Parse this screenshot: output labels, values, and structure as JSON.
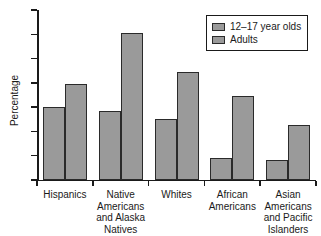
{
  "chart_data": {
    "type": "bar",
    "title": "",
    "xlabel": "",
    "ylabel": "Percentage",
    "ylim": [
      0,
      14
    ],
    "yticks": [
      0,
      2,
      4,
      6,
      8,
      10,
      12,
      14
    ],
    "ytick_labels": [
      "0",
      "2",
      "4",
      "6",
      "8",
      "10",
      "12",
      "14"
    ],
    "grid": false,
    "legend_position": "top-right",
    "categories": [
      "Hispanics",
      "Native Americans and Alaska Natives",
      "Whites",
      "African Americans",
      "Asian Americans and Pacific Islanders"
    ],
    "category_label_lines": [
      [
        "Hispanics"
      ],
      [
        "Native",
        "Americans",
        "and Alaska",
        "Natives"
      ],
      [
        "Whites"
      ],
      [
        "African",
        "Americans"
      ],
      [
        "Asian",
        "Americans",
        "and Pacific",
        "Islanders"
      ]
    ],
    "series": [
      {
        "name": "12–17 year olds",
        "color": "#9a9a9a",
        "values": [
          6.0,
          5.7,
          5.0,
          1.8,
          1.65
        ]
      },
      {
        "name": "Adults",
        "color": "#9a9a9a",
        "values": [
          7.9,
          12.1,
          8.9,
          6.9,
          4.5
        ]
      }
    ]
  },
  "legend": {
    "items": [
      {
        "label": "12–17 year olds"
      },
      {
        "label": "Adults"
      }
    ]
  },
  "axes": {
    "y_label": "Percentage"
  },
  "colors": {
    "bar_fill": "#9a9a9a",
    "bar_stroke": "#2a2a2a",
    "axis": "#1a1a1a",
    "background": "#ffffff"
  }
}
